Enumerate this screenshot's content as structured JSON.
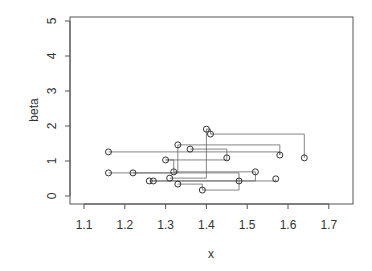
{
  "chart_data": {
    "type": "line",
    "subtype": "step lines with circle markers",
    "title": "",
    "xlabel": "x",
    "ylabel": "beta",
    "xlim": [
      1.07,
      1.76
    ],
    "ylim": [
      -0.2,
      5.1
    ],
    "x_ticks": [
      "1.1",
      "1.2",
      "1.3",
      "1.4",
      "1.5",
      "1.6",
      "1.7"
    ],
    "y_ticks": [
      "0",
      "1",
      "2",
      "3",
      "4",
      "5"
    ],
    "grid": false,
    "legend": null,
    "points": [
      {
        "x": 1.16,
        "y": 1.26
      },
      {
        "x": 1.16,
        "y": 0.66
      },
      {
        "x": 1.22,
        "y": 0.66
      },
      {
        "x": 1.26,
        "y": 0.43
      },
      {
        "x": 1.27,
        "y": 0.43
      },
      {
        "x": 1.3,
        "y": 1.03
      },
      {
        "x": 1.31,
        "y": 0.51
      },
      {
        "x": 1.32,
        "y": 0.69
      },
      {
        "x": 1.33,
        "y": 0.34
      },
      {
        "x": 1.33,
        "y": 1.46
      },
      {
        "x": 1.36,
        "y": 1.34
      },
      {
        "x": 1.39,
        "y": 0.17
      },
      {
        "x": 1.4,
        "y": 1.91
      },
      {
        "x": 1.41,
        "y": 1.77
      },
      {
        "x": 1.45,
        "y": 1.09
      },
      {
        "x": 1.48,
        "y": 0.43
      },
      {
        "x": 1.52,
        "y": 0.69
      },
      {
        "x": 1.57,
        "y": 0.49
      },
      {
        "x": 1.58,
        "y": 1.17
      },
      {
        "x": 1.64,
        "y": 1.09
      }
    ],
    "connections": [
      [
        0,
        18
      ],
      [
        1,
        2
      ],
      [
        2,
        15
      ],
      [
        3,
        16
      ],
      [
        4,
        17
      ],
      [
        5,
        14
      ],
      [
        6,
        12
      ],
      [
        7,
        16
      ],
      [
        8,
        11
      ],
      [
        9,
        18
      ],
      [
        10,
        14
      ],
      [
        11,
        15
      ],
      [
        12,
        13
      ],
      [
        13,
        19
      ],
      [
        2,
        9
      ],
      [
        5,
        7
      ]
    ]
  }
}
